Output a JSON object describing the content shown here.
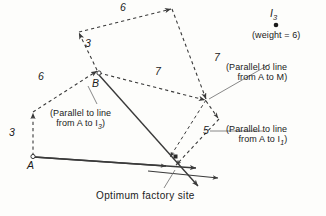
{
  "figure": {
    "background_color": "#fdfdfb",
    "line_color": "#3a3a3a",
    "text_color": "#1a1a1a"
  },
  "points": {
    "a": {
      "label": "A",
      "x": 33,
      "y": 157
    },
    "b": {
      "label": "B",
      "x": 98,
      "y": 73
    },
    "i3": {
      "label": "I",
      "sub": "3",
      "x": 272,
      "y": 14
    },
    "optimum": {
      "x": 176,
      "y": 166
    }
  },
  "segment_labels": [
    {
      "name": "left-lower-6",
      "text": "6",
      "x": 41,
      "y": 78
    },
    {
      "name": "top-6",
      "text": "6",
      "x": 123,
      "y": 8
    },
    {
      "name": "left-vertical-3",
      "text": "3",
      "x": 13,
      "y": 134
    },
    {
      "name": "b-upper-3",
      "text": "3",
      "x": 88,
      "y": 44
    },
    {
      "name": "middle-7",
      "text": "7",
      "x": 158,
      "y": 72
    },
    {
      "name": "right-7",
      "text": "7",
      "x": 217,
      "y": 58
    },
    {
      "name": "lower-5",
      "text": "5",
      "x": 205,
      "y": 131
    }
  ],
  "annotations": {
    "weight_note": "(weight = 6)",
    "parallel_am": {
      "line1": "(Parallel to line",
      "line2": "from A to M)"
    },
    "parallel_i1": {
      "line1": "(Parallel to line",
      "line2": "from A to I",
      "sub": "1",
      "close": ")"
    },
    "parallel_i3": {
      "line1": "(Parallel to line",
      "line2": "from A to I",
      "sub": "3",
      "close": ")"
    },
    "optimum_caption": "Optimum factory site"
  }
}
